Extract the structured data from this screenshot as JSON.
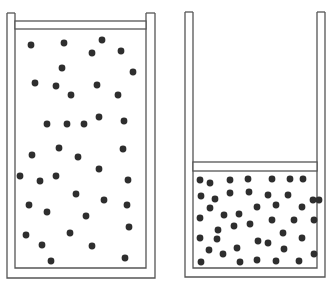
{
  "figure": {
    "colors": {
      "background": "#ffffff",
      "outline": "#555555",
      "particle": "#2e2e2e"
    }
  },
  "containers": [
    {
      "name": "left-container",
      "state": "expanded",
      "outer": {
        "x": 7,
        "y": 13,
        "w": 148,
        "h": 265
      },
      "inner": {
        "x": 15,
        "y": 13,
        "w": 131,
        "h": 255
      },
      "piston": {
        "x": 15,
        "y": 21,
        "w": 131,
        "h": 8
      },
      "particles": [
        [
          31,
          45
        ],
        [
          64,
          43
        ],
        [
          102,
          40
        ],
        [
          92,
          53
        ],
        [
          121,
          51
        ],
        [
          62,
          68
        ],
        [
          133,
          72
        ],
        [
          35,
          83
        ],
        [
          56,
          86
        ],
        [
          97,
          85
        ],
        [
          71,
          95
        ],
        [
          118,
          95
        ],
        [
          47,
          124
        ],
        [
          67,
          124
        ],
        [
          84,
          124
        ],
        [
          99,
          117
        ],
        [
          124,
          121
        ],
        [
          32,
          155
        ],
        [
          59,
          148
        ],
        [
          78,
          157
        ],
        [
          123,
          149
        ],
        [
          99,
          169
        ],
        [
          20,
          176
        ],
        [
          40,
          181
        ],
        [
          56,
          176
        ],
        [
          128,
          180
        ],
        [
          76,
          194
        ],
        [
          104,
          200
        ],
        [
          29,
          205
        ],
        [
          47,
          212
        ],
        [
          86,
          216
        ],
        [
          127,
          205
        ],
        [
          26,
          235
        ],
        [
          70,
          233
        ],
        [
          129,
          227
        ],
        [
          42,
          245
        ],
        [
          92,
          246
        ],
        [
          51,
          261
        ],
        [
          125,
          258
        ]
      ]
    },
    {
      "name": "right-container",
      "state": "compressed",
      "outer": {
        "x": 185,
        "y": 12,
        "w": 140,
        "h": 265
      },
      "inner": {
        "x": 193,
        "y": 12,
        "w": 124,
        "h": 256
      },
      "piston": {
        "x": 193,
        "y": 162,
        "w": 124,
        "h": 9
      },
      "particles": [
        [
          200,
          180
        ],
        [
          210,
          183
        ],
        [
          230,
          180
        ],
        [
          248,
          179
        ],
        [
          272,
          179
        ],
        [
          290,
          179
        ],
        [
          303,
          179
        ],
        [
          201,
          196
        ],
        [
          215,
          199
        ],
        [
          230,
          193
        ],
        [
          249,
          192
        ],
        [
          268,
          195
        ],
        [
          288,
          195
        ],
        [
          313,
          200
        ],
        [
          210,
          208
        ],
        [
          224,
          215
        ],
        [
          239,
          214
        ],
        [
          257,
          207
        ],
        [
          276,
          205
        ],
        [
          302,
          207
        ],
        [
          319,
          200
        ],
        [
          200,
          218
        ],
        [
          234,
          226
        ],
        [
          250,
          224
        ],
        [
          272,
          220
        ],
        [
          294,
          220
        ],
        [
          314,
          220
        ],
        [
          218,
          230
        ],
        [
          283,
          233
        ],
        [
          200,
          238
        ],
        [
          217,
          239
        ],
        [
          258,
          241
        ],
        [
          302,
          238
        ],
        [
          209,
          250
        ],
        [
          223,
          254
        ],
        [
          237,
          248
        ],
        [
          284,
          249
        ],
        [
          314,
          254
        ],
        [
          268,
          243
        ],
        [
          201,
          262
        ],
        [
          240,
          262
        ],
        [
          257,
          260
        ],
        [
          276,
          261
        ],
        [
          299,
          261
        ]
      ]
    }
  ]
}
